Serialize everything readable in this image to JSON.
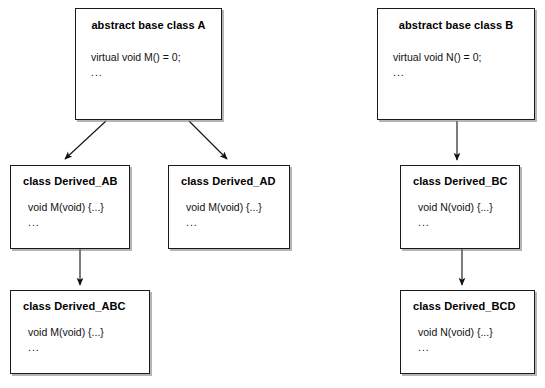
{
  "diagram": {
    "stroke_color": "#1a1a1a",
    "background_color": "#ffffff",
    "shadow_color": "#787878",
    "boxes": [
      {
        "id": "base-a",
        "title": "abstract base class A",
        "title_align": "center",
        "line1": "virtual void M() = 0;",
        "line2": "..."
      },
      {
        "id": "base-b",
        "title": "abstract base class B",
        "title_align": "center",
        "line1": "virtual void N() = 0;",
        "line2": "..."
      },
      {
        "id": "derived-ab",
        "title": "class Derived_AB",
        "title_align": "left",
        "line1": "void M(void)  {...}",
        "line2": "..."
      },
      {
        "id": "derived-ad",
        "title": "class Derived_AD",
        "title_align": "left",
        "line1": "void M(void)  {...}",
        "line2": "..."
      },
      {
        "id": "derived-bc",
        "title": "class Derived_BC",
        "title_align": "left",
        "line1": "void N(void)  {...}",
        "line2": "..."
      },
      {
        "id": "derived-abc",
        "title": "class Derived_ABC",
        "title_align": "left",
        "line1": "void M(void)  {...}",
        "line2": "..."
      },
      {
        "id": "derived-bcd",
        "title": "class Derived_BCD",
        "title_align": "left",
        "line1": "void N(void)  {...}",
        "line2": "..."
      }
    ],
    "edges": [
      {
        "id": "a-to-ab",
        "from": "base-a",
        "to": "derived-ab",
        "kind": "diagonal-arrow"
      },
      {
        "id": "a-to-ad",
        "from": "base-a",
        "to": "derived-ad",
        "kind": "diagonal-arrow"
      },
      {
        "id": "ab-to-abc",
        "from": "derived-ab",
        "to": "derived-abc",
        "kind": "vertical-arrow"
      },
      {
        "id": "b-to-bc",
        "from": "base-b",
        "to": "derived-bc",
        "kind": "vertical-arrow"
      },
      {
        "id": "bc-to-bcd",
        "from": "derived-bc",
        "to": "derived-bcd",
        "kind": "vertical-arrow"
      }
    ]
  }
}
